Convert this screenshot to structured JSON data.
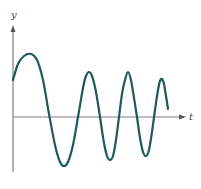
{
  "figure": {
    "axis_labels": {
      "y": "y",
      "x": "t"
    },
    "colors": {
      "curve": "#1f5a55",
      "axis": "#808080",
      "label": "#444444"
    },
    "curve_points": [
      [
        13,
        80
      ],
      [
        18,
        64
      ],
      [
        24,
        56
      ],
      [
        31,
        54
      ],
      [
        37,
        60
      ],
      [
        43,
        80
      ],
      [
        49,
        114
      ],
      [
        55,
        145
      ],
      [
        60,
        162
      ],
      [
        64,
        166
      ],
      [
        68,
        162
      ],
      [
        73,
        145
      ],
      [
        78,
        117
      ],
      [
        83,
        88
      ],
      [
        86,
        76
      ],
      [
        89,
        72
      ],
      [
        92,
        76
      ],
      [
        96,
        92
      ],
      [
        100,
        117
      ],
      [
        104,
        143
      ],
      [
        107,
        156
      ],
      [
        110,
        160
      ],
      [
        113,
        156
      ],
      [
        116,
        140
      ],
      [
        119,
        117
      ],
      [
        122,
        94
      ],
      [
        125,
        80
      ],
      [
        128,
        72
      ],
      [
        131,
        80
      ],
      [
        134,
        98
      ],
      [
        137,
        117
      ],
      [
        140,
        138
      ],
      [
        143,
        152
      ],
      [
        146,
        156
      ],
      [
        149,
        150
      ],
      [
        152,
        132
      ],
      [
        155,
        110
      ],
      [
        158,
        90
      ],
      [
        160,
        81
      ],
      [
        162,
        79
      ],
      [
        164,
        84
      ],
      [
        166,
        96
      ],
      [
        168,
        109
      ]
    ]
  }
}
